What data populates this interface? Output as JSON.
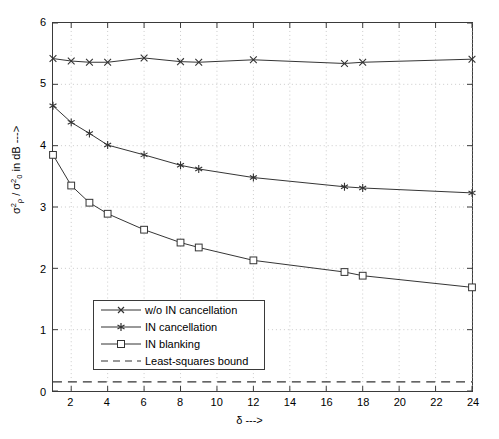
{
  "chart_data": {
    "type": "line",
    "title": "",
    "xlabel": "δ --->",
    "ylabel": "σ²ₚ / σ²₀ in dB --->",
    "xlim": [
      1,
      24
    ],
    "ylim": [
      0,
      6
    ],
    "xticks": [
      2,
      4,
      6,
      8,
      10,
      12,
      14,
      16,
      18,
      20,
      22,
      24
    ],
    "yticks": [
      0,
      1,
      2,
      3,
      4,
      5,
      6
    ],
    "grid": "dotted",
    "legend_position": "lower-left",
    "x": [
      1,
      2,
      3,
      4,
      6,
      8,
      9,
      12,
      17,
      18,
      24
    ],
    "series": [
      {
        "name": "w/o IN cancellation",
        "marker": "x",
        "linestyle": "solid",
        "color": "#333333",
        "values": [
          5.42,
          5.38,
          5.36,
          5.36,
          5.43,
          5.37,
          5.36,
          5.4,
          5.34,
          5.36,
          5.41
        ]
      },
      {
        "name": "IN cancellation",
        "marker": "star",
        "linestyle": "solid",
        "color": "#333333",
        "values": [
          4.65,
          4.38,
          4.2,
          4.01,
          3.85,
          3.68,
          3.62,
          3.48,
          3.33,
          3.31,
          3.23
        ]
      },
      {
        "name": "IN blanking",
        "marker": "square",
        "linestyle": "solid",
        "color": "#333333",
        "values": [
          3.85,
          3.35,
          3.07,
          2.89,
          2.63,
          2.42,
          2.34,
          2.13,
          1.94,
          1.88,
          1.69
        ]
      },
      {
        "name": "Least-squares bound",
        "marker": "none",
        "linestyle": "dashed",
        "color": "#333333",
        "constant": 0.15
      }
    ]
  },
  "axes": {
    "ytick_labels": [
      "6",
      "5",
      "4",
      "3",
      "2",
      "1",
      "0"
    ],
    "xtick_labels": [
      "2",
      "4",
      "6",
      "8",
      "10",
      "12",
      "14",
      "16",
      "18",
      "20",
      "22",
      "24"
    ],
    "xlabel_symbol": "δ",
    "xlabel_arrow": "--->",
    "ylabel_num_sigma": "σ",
    "ylabel_num_sup": "2",
    "ylabel_num_sub": "ρ",
    "ylabel_sep": " / ",
    "ylabel_den_sigma": "σ",
    "ylabel_den_sup": "2",
    "ylabel_den_sub": "0",
    "ylabel_tail": " in dB --->"
  },
  "legend": {
    "items": [
      {
        "label": "w/o IN cancellation",
        "marker": "x-marker"
      },
      {
        "label": "IN cancellation",
        "marker": "star-marker"
      },
      {
        "label": "IN blanking",
        "marker": "square-marker"
      },
      {
        "label": "Least-squares bound",
        "marker": "dashed-line"
      }
    ]
  }
}
